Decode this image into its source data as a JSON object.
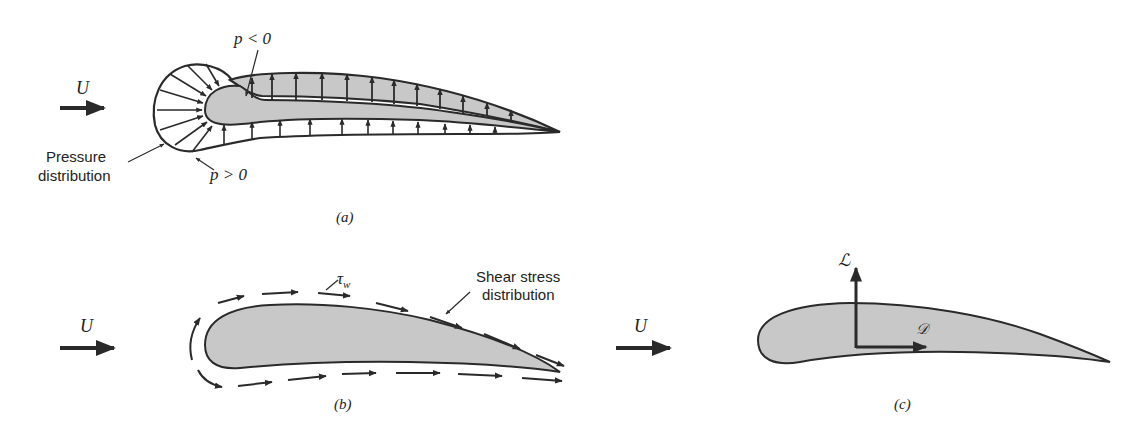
{
  "figure": {
    "colors": {
      "ink": "#2a2a2a",
      "foil_fill": "#c8c8c8",
      "background": "#ffffff"
    },
    "panel_a": {
      "caption": "(a)",
      "freestream_label": "U",
      "suction_label": "p < 0",
      "pressure_label": "p > 0",
      "distribution_label_line1": "Pressure",
      "distribution_label_line2": "distribution"
    },
    "panel_b": {
      "caption": "(b)",
      "freestream_label": "U",
      "wall_shear_label": "τ",
      "wall_shear_subscript": "w",
      "distribution_label_line1": "Shear stress",
      "distribution_label_line2": "distribution"
    },
    "panel_c": {
      "caption": "(c)",
      "freestream_label": "U",
      "lift_label": "ℒ",
      "drag_label": "𝒟"
    }
  }
}
